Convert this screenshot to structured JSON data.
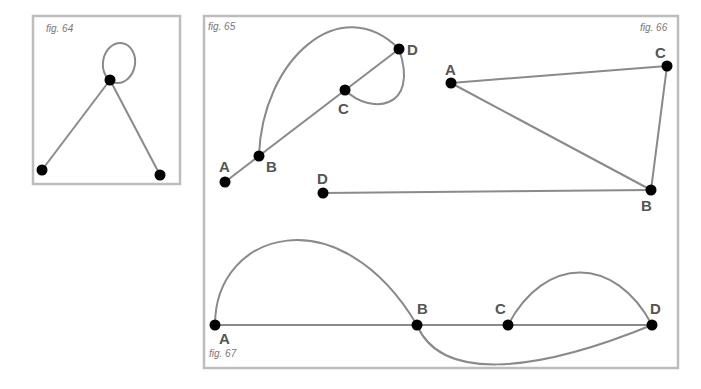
{
  "figures": {
    "fig64": {
      "caption": "fig. 64"
    },
    "fig65": {
      "caption": "fig. 65",
      "labels": {
        "A": "A",
        "B": "B",
        "C": "C",
        "D": "D"
      }
    },
    "fig66": {
      "caption": "fig. 66",
      "labels": {
        "A": "A",
        "B": "B",
        "C": "C",
        "D": "D"
      }
    },
    "fig67": {
      "caption": "fig. 67",
      "labels": {
        "A": "A",
        "B": "B",
        "C": "C",
        "D": "D"
      }
    }
  },
  "colors": {
    "border": "#bdbdbd",
    "edge": "#8a8a8a",
    "node": "#000000",
    "label": "#555555"
  }
}
